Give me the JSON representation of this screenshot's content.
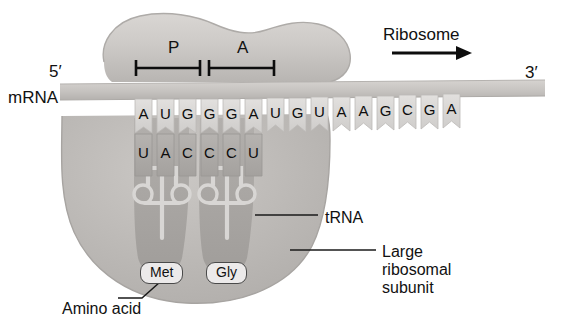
{
  "figure": {
    "type": "biology-diagram"
  },
  "labels": {
    "mrna": "mRNA",
    "five_prime": "5′",
    "three_prime": "3′",
    "ribosome": "Ribosome",
    "trna": "tRNA",
    "large_subunit_line1": "Large",
    "large_subunit_line2": "ribosomal",
    "large_subunit_line3": "subunit",
    "amino_acid": "Amino acid",
    "p_site": "P",
    "a_site": "A"
  },
  "mrna_sequence": [
    "A",
    "U",
    "G",
    "G",
    "G",
    "A",
    "U",
    "G",
    "U",
    "A",
    "A",
    "G",
    "C",
    "G",
    "A"
  ],
  "anticodon_sequence": [
    "U",
    "A",
    "C",
    "C",
    "C",
    "U"
  ],
  "codons": [
    {
      "site": "P",
      "codon": "AUG",
      "anticodon": "UAC",
      "amino_acid": "Met"
    },
    {
      "site": "A",
      "codon": "GGA",
      "anticodon": "CCU",
      "amino_acid": "Gly"
    }
  ],
  "amino_acids": [
    {
      "name": "Met",
      "site": "P"
    },
    {
      "name": "Gly",
      "site": "A"
    }
  ],
  "colors": {
    "small_subunit": "#c9c6c3",
    "large_subunit": "#bdbab7",
    "mrna_strand": "#c6c3c0",
    "nucleotide": "#d5d3d1",
    "trna_body": "#a9a6a3",
    "stroke": "#141414",
    "text": "#111111",
    "badge_fill": "#eceaea"
  },
  "nucleotide_x": [
    135,
    157,
    179,
    201,
    223,
    245,
    267,
    289,
    311,
    333,
    355,
    377,
    399,
    421,
    443
  ]
}
